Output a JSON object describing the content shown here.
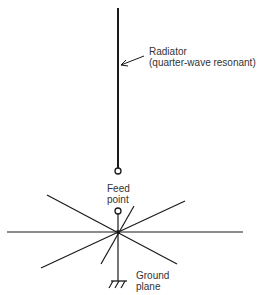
{
  "diagram": {
    "type": "ground-plane antenna",
    "labels": {
      "radiator_line1": "Radiator",
      "radiator_line2": "(quarter-wave resonant)",
      "feed_line1": "Feed",
      "feed_line2": "point",
      "ground_line1": "Ground",
      "ground_line2": "plane"
    },
    "colors": {
      "line": "#1a1a1a",
      "text": "#333333",
      "background": "#ffffff"
    }
  }
}
